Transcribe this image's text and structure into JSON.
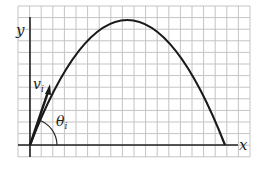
{
  "diagram": {
    "labels": {
      "y_axis": "y",
      "x_axis": "x",
      "velocity": "v",
      "velocity_sub": "i",
      "angle": "θ",
      "angle_sub": "i"
    },
    "colors": {
      "grid": "#bdbdbd",
      "axes": "#222222",
      "curve": "#1a1a1a",
      "background": "#ffffff"
    },
    "grid": {
      "x0": 18,
      "y0": 6,
      "x1": 250,
      "y1": 157,
      "spacing": 11.6
    },
    "origin": {
      "x": 30,
      "y": 145
    },
    "trajectory": {
      "start": [
        30,
        145
      ],
      "peak": [
        127,
        20
      ],
      "end": [
        225,
        145
      ]
    },
    "velocity_vector": {
      "from": [
        30,
        145
      ],
      "to": [
        50,
        86
      ]
    }
  }
}
